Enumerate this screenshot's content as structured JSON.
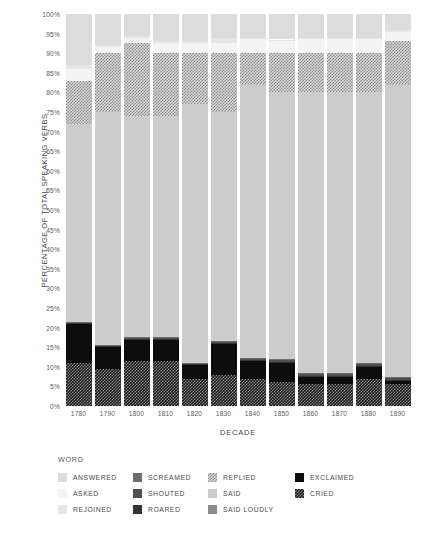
{
  "chart_data": {
    "type": "bar",
    "subtype": "stacked-percentage",
    "title": "",
    "xlabel": "DECADE",
    "ylabel": "PERCENTAGE OF TOTAL SPEAKING VERBS",
    "legend_title": "WORD",
    "legend_position": "bottom",
    "grid": false,
    "ylim": [
      0,
      100
    ],
    "ytick_labels": [
      "100%",
      "95%",
      "90%",
      "85%",
      "80%",
      "75%",
      "70%",
      "65%",
      "60%",
      "55%",
      "50%",
      "45%",
      "40%",
      "35%",
      "30%",
      "25%",
      "20%",
      "15%",
      "10%",
      "5%",
      "0%"
    ],
    "ytick_values": [
      100,
      95,
      90,
      85,
      80,
      75,
      70,
      65,
      60,
      55,
      50,
      45,
      40,
      35,
      30,
      25,
      20,
      15,
      10,
      5,
      0
    ],
    "categories": [
      "1780",
      "1790",
      "1800",
      "1810",
      "1820",
      "1830",
      "1840",
      "1850",
      "1860",
      "1870",
      "1880",
      "1890"
    ],
    "stack_order_bottom_to_top": [
      "CRIED",
      "EXCLAIMED",
      "ROARED",
      "SHOUTED",
      "SCREAMED",
      "SAID",
      "SAID LOUDLY",
      "REPLIED",
      "ASKED",
      "REJOINED",
      "ANSWERED"
    ],
    "series": [
      {
        "name": "CRIED",
        "values": [
          11.0,
          9.5,
          11.5,
          11.5,
          7.0,
          8.0,
          7.0,
          6.0,
          5.5,
          5.5,
          7.0,
          5.5
        ]
      },
      {
        "name": "EXCLAIMED",
        "values": [
          10.0,
          5.5,
          5.5,
          5.5,
          3.5,
          8.0,
          4.5,
          5.0,
          2.0,
          2.0,
          3.0,
          1.0
        ]
      },
      {
        "name": "ROARED",
        "values": [
          0.2,
          0.2,
          0.2,
          0.2,
          0.2,
          0.2,
          0.2,
          0.2,
          0.2,
          0.2,
          0.2,
          0.2
        ]
      },
      {
        "name": "SHOUTED",
        "values": [
          0.2,
          0.3,
          0.3,
          0.3,
          0.3,
          0.3,
          0.4,
          0.5,
          0.5,
          0.5,
          0.5,
          0.6
        ]
      },
      {
        "name": "SCREAMED",
        "values": [
          0.1,
          0.1,
          0.1,
          0.1,
          0.1,
          0.1,
          0.1,
          0.2,
          0.2,
          0.2,
          0.2,
          0.2
        ]
      },
      {
        "name": "SAID",
        "values": [
          50.5,
          59.4,
          56.4,
          56.4,
          65.9,
          58.4,
          69.8,
          68.1,
          71.6,
          71.6,
          69.1,
          74.5
        ]
      },
      {
        "name": "SAID LOUDLY",
        "values": [
          0.0,
          0.0,
          0.0,
          0.0,
          0.0,
          0.0,
          0.0,
          0.0,
          0.0,
          0.0,
          0.0,
          0.0
        ]
      },
      {
        "name": "REPLIED",
        "values": [
          11.0,
          15.0,
          18.5,
          16.0,
          13.0,
          15.0,
          8.0,
          10.0,
          10.0,
          10.0,
          10.0,
          11.0
        ]
      },
      {
        "name": "ASKED",
        "values": [
          3.0,
          1.5,
          1.5,
          2.5,
          2.5,
          2.5,
          3.5,
          3.0,
          3.5,
          3.5,
          3.5,
          2.5
        ]
      },
      {
        "name": "REJOINED",
        "values": [
          1.0,
          0.5,
          0.5,
          0.5,
          0.5,
          1.5,
          0.5,
          0.5,
          0.5,
          0.5,
          0.5,
          0.5
        ]
      },
      {
        "name": "ANSWERED",
        "values": [
          13.0,
          8.0,
          5.5,
          7.0,
          7.0,
          6.0,
          6.0,
          6.5,
          6.0,
          6.0,
          6.0,
          4.0
        ]
      }
    ]
  },
  "legend": {
    "title": "WORD",
    "columns": [
      [
        {
          "label": "ANSWERED",
          "style": "solid",
          "color": "#dcdcdc"
        },
        {
          "label": "ASKED",
          "style": "solid",
          "color": "#f4f4f4"
        },
        {
          "label": "REJOINED",
          "style": "solid",
          "color": "#e6e6e6"
        }
      ],
      [
        {
          "label": "SCREAMED",
          "style": "solid",
          "color": "#6e6e6e"
        },
        {
          "label": "SHOUTED",
          "style": "solid",
          "color": "#4f4f4f"
        },
        {
          "label": "ROARED",
          "style": "solid",
          "color": "#333333"
        }
      ],
      [
        {
          "label": "REPLIED",
          "style": "checker-light",
          "color": "#b0b0b0"
        },
        {
          "label": "SAID",
          "style": "solid",
          "color": "#cccccc"
        },
        {
          "label": "SAID LOUDLY",
          "style": "solid",
          "color": "#8c8c8c"
        }
      ],
      [
        {
          "label": "EXCLAIMED",
          "style": "solid",
          "color": "#0d0d0d"
        },
        {
          "label": "CRIED",
          "style": "checker-dark",
          "color": "#1a1a1a"
        }
      ]
    ]
  },
  "colors": {
    "ANSWERED": "#dcdcdc",
    "ASKED": "#f4f4f4",
    "REJOINED": "#e6e6e6",
    "SCREAMED": "#6e6e6e",
    "SHOUTED": "#4f4f4f",
    "ROARED": "#333333",
    "REPLIED": "#b0b0b0",
    "SAID": "#cccccc",
    "SAID LOUDLY": "#8c8c8c",
    "EXCLAIMED": "#0d0d0d",
    "CRIED": "#1a1a1a",
    "background": "#ffffff",
    "text": "#46494d"
  }
}
